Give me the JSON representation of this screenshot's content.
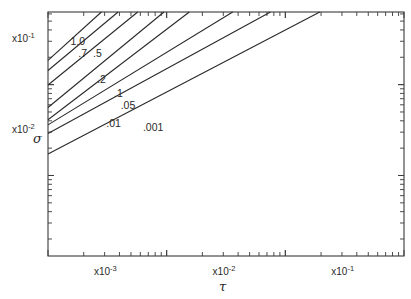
{
  "chart_data": {
    "type": "line",
    "title": "",
    "xlabel": "τ",
    "ylabel": "σ",
    "xscale": "log",
    "yscale": "log",
    "xlim": [
      0.001,
      1.0
    ],
    "ylim": [
      0.0013,
      0.63
    ],
    "grid": false,
    "legend": "none (curves labeled inline)",
    "x_decade_labels": [
      {
        "text": "x10",
        "exp": "-3",
        "tau": 0.0032
      },
      {
        "text": "x10",
        "exp": "-2",
        "tau": 0.032
      },
      {
        "text": "x10",
        "exp": "-1",
        "tau": 0.32
      }
    ],
    "y_decade_labels": [
      {
        "text": "x10",
        "exp": "-1",
        "sigma": 0.32
      },
      {
        "text": "x10",
        "exp": "-2",
        "sigma": 0.032
      }
    ],
    "series": [
      {
        "name": "1.0",
        "label": "1.0",
        "x": [
          0.001,
          0.00282
        ],
        "y": [
          0.185,
          0.63
        ],
        "label_at": [
          0.00155,
          0.27
        ]
      },
      {
        "name": "0.7",
        "label": ".7",
        "x": [
          0.001,
          0.0039
        ],
        "y": [
          0.143,
          0.63
        ],
        "label_at": [
          0.0018,
          0.2
        ]
      },
      {
        "name": "0.5",
        "label": ".5",
        "x": [
          0.001,
          0.0057
        ],
        "y": [
          0.099,
          0.63
        ],
        "label_at": [
          0.0024,
          0.2
        ]
      },
      {
        "name": "0.2",
        "label": ".2",
        "x": [
          0.001,
          0.0095
        ],
        "y": [
          0.056,
          0.63
        ],
        "label_at": [
          0.0026,
          0.105
        ]
      },
      {
        "name": "0.1",
        "label": ".1",
        "x": [
          0.001,
          0.0155
        ],
        "y": [
          0.041,
          0.63
        ],
        "label_at": [
          0.0036,
          0.074
        ]
      },
      {
        "name": "0.05",
        "label": ".05",
        "x": [
          0.001,
          0.036
        ],
        "y": [
          0.036,
          0.63
        ],
        "label_at": [
          0.0041,
          0.054
        ]
      },
      {
        "name": "0.01",
        "label": ".01",
        "x": [
          0.001,
          0.075
        ],
        "y": [
          0.029,
          0.63
        ],
        "label_at": [
          0.0031,
          0.034
        ]
      },
      {
        "name": "0.001",
        "label": ".001",
        "x": [
          0.001,
          0.195
        ],
        "y": [
          0.0173,
          0.63
        ],
        "label_at": [
          0.0063,
          0.031
        ]
      }
    ]
  },
  "axes": {
    "x_symbol": "τ",
    "y_symbol": "σ"
  }
}
